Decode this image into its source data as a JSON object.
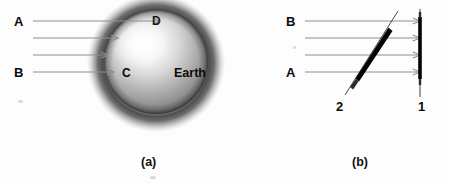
{
  "figure": {
    "background_color": "#fdfdfd",
    "width": 449,
    "height": 185
  },
  "panel_a": {
    "caption": "(a)",
    "body_label": "Earth",
    "ray_labels": {
      "top": "A",
      "bottom": "B"
    },
    "surface_points": {
      "top": "D",
      "left": "C"
    },
    "ray_count": 4,
    "ray_color": "#8f8f8f",
    "sphere": {
      "center_x": 156,
      "center_y": 62,
      "radius": 52,
      "highlight_color": "#fafafa",
      "body_color": "#9a9a9a",
      "halo_color": "#3a3a3a"
    }
  },
  "panel_b": {
    "caption": "(b)",
    "ray_labels": {
      "top": "B",
      "bottom": "A"
    },
    "surface_labels": {
      "slanted": "2",
      "vertical": "1"
    },
    "ray_count": 4,
    "ray_color": "#8f8f8f",
    "surface_color": "#050505"
  }
}
